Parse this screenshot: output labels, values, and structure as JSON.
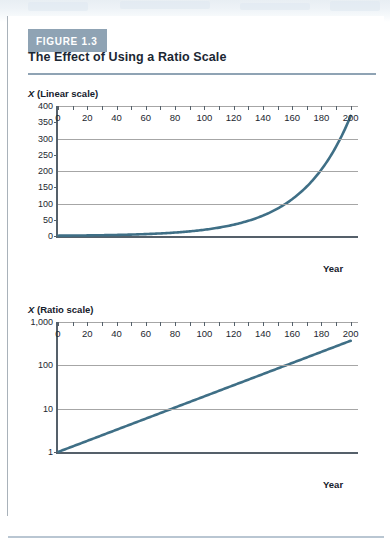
{
  "figure": {
    "badge_label": "FIGURE 1.3",
    "title": "The Effect of Using a Ratio Scale",
    "badge_color": "#8fa3b4",
    "rule_color": "#8fa3b4",
    "curve_color": "#3f6f86"
  },
  "charts": [
    {
      "caption_var": "X",
      "caption_rest": " (Linear scale)",
      "x_axis_title": "Year",
      "y_labels": [
        "400",
        "350",
        "300",
        "250",
        "200",
        "150",
        "100",
        "50",
        "0"
      ],
      "x_labels": [
        "0",
        "20",
        "40",
        "60",
        "80",
        "100",
        "120",
        "140",
        "160",
        "180",
        "200"
      ]
    },
    {
      "caption_var": "X",
      "caption_rest": " (Ratio scale)",
      "x_axis_title": "Year",
      "y_labels": [
        "1,000",
        "100",
        "10",
        "1"
      ],
      "x_labels": [
        "0",
        "20",
        "40",
        "60",
        "80",
        "100",
        "120",
        "140",
        "160",
        "180",
        "200"
      ]
    }
  ],
  "chart_data": [
    {
      "type": "line",
      "title": "X (Linear scale)",
      "subtitle": "The Effect of Using a Ratio Scale",
      "xlabel": "Year",
      "ylabel": "X (Linear scale)",
      "yscale": "linear",
      "xlim": [
        0,
        205
      ],
      "ylim": [
        0,
        400
      ],
      "yticks": [
        0,
        50,
        100,
        150,
        200,
        250,
        300,
        350,
        400
      ],
      "ytick_labels": [
        "0",
        "50",
        "100",
        "150",
        "200",
        "250",
        "300",
        "350",
        "400"
      ],
      "gridlines_y": [
        100,
        200,
        300,
        400
      ],
      "xticks": [
        0,
        10,
        20,
        30,
        40,
        50,
        60,
        70,
        80,
        90,
        100,
        110,
        120,
        130,
        140,
        150,
        160,
        170,
        180,
        190,
        200
      ],
      "xtick_labels": [
        "0",
        "20",
        "40",
        "60",
        "80",
        "100",
        "120",
        "140",
        "160",
        "180",
        "200"
      ],
      "grid": "horizontal",
      "legend": "none",
      "series": [
        {
          "name": "X = 1.03^t (exponential growth, 3% per year)",
          "color": "#3f6f86",
          "x": [
            0,
            20,
            40,
            60,
            80,
            100,
            120,
            140,
            160,
            180,
            200
          ],
          "y": [
            1,
            1.8,
            3.3,
            5.9,
            10.6,
            19.2,
            34.7,
            62.6,
            113.1,
            204.5,
            369.4
          ]
        }
      ]
    },
    {
      "type": "line",
      "title": "X (Ratio scale)",
      "xlabel": "Year",
      "ylabel": "X (Ratio scale)",
      "yscale": "log",
      "xlim": [
        0,
        205
      ],
      "ylim": [
        1,
        1000
      ],
      "yticks": [
        1,
        10,
        100,
        1000
      ],
      "ytick_labels": [
        "1",
        "10",
        "100",
        "1,000"
      ],
      "gridlines_y": [
        10,
        100,
        1000
      ],
      "xticks": [
        0,
        10,
        20,
        30,
        40,
        50,
        60,
        70,
        80,
        90,
        100,
        110,
        120,
        130,
        140,
        150,
        160,
        170,
        180,
        190,
        200
      ],
      "xtick_labels": [
        "0",
        "20",
        "40",
        "60",
        "80",
        "100",
        "120",
        "140",
        "160",
        "180",
        "200"
      ],
      "grid": "horizontal",
      "legend": "none",
      "series": [
        {
          "name": "X = 1.03^t (exponential growth, 3% per year)",
          "color": "#3f6f86",
          "x": [
            0,
            20,
            40,
            60,
            80,
            100,
            120,
            140,
            160,
            180,
            200
          ],
          "y": [
            1,
            1.8,
            3.3,
            5.9,
            10.6,
            19.2,
            34.7,
            62.6,
            113.1,
            204.5,
            369.4
          ]
        }
      ]
    }
  ]
}
